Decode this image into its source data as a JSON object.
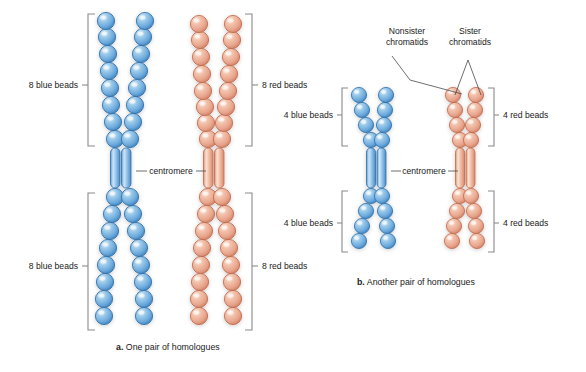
{
  "figure": {
    "background_color": "#ffffff",
    "bead_blue": "#6aa9dd",
    "bead_blue_dark": "#2f6fa8",
    "bead_red": "#e8a48c",
    "bead_red_dark": "#c06a4c",
    "text_color": "#1a1a1a",
    "bracket_color": "#8a8a8a"
  },
  "panel_a": {
    "caption_marker": "a.",
    "caption_text": "One pair of homologues",
    "centromere_label": "centromere",
    "labels": {
      "top_left": "8 blue beads",
      "bottom_left": "8 blue beads",
      "top_right": "8 red beads",
      "bottom_right": "8 red beads"
    },
    "bead_counts": {
      "blue_upper_arm": 8,
      "blue_lower_arm": 8,
      "red_upper_arm": 8,
      "red_lower_arm": 8
    }
  },
  "panel_b": {
    "caption_marker": "b.",
    "caption_text": "Another pair of homologues",
    "centromere_label": "centromere",
    "callouts": {
      "nonsister_line1": "Nonsister",
      "nonsister_line2": "chromatids",
      "sister_line1": "Sister",
      "sister_line2": "chromatids"
    },
    "labels": {
      "top_left": "4 blue beads",
      "bottom_left": "4 blue beads",
      "top_right": "4 red beads",
      "bottom_right": "4 red beads"
    },
    "bead_counts": {
      "blue_upper_arm": 4,
      "blue_lower_arm": 4,
      "red_upper_arm": 4,
      "red_lower_arm": 4
    }
  }
}
